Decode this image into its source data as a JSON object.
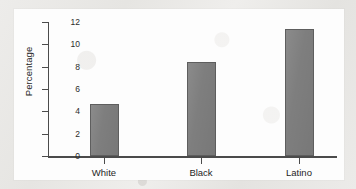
{
  "chart_data": {
    "type": "bar",
    "title": "",
    "subtitle": "",
    "xlabel": "",
    "ylabel": "Percentage",
    "categories": [
      "White",
      "Black",
      "Latino"
    ],
    "values": [
      4.7,
      8.4,
      11.4
    ],
    "series": [
      {
        "name": "Percentage",
        "values": [
          4.7,
          8.4,
          11.4
        ]
      }
    ],
    "ylim": [
      0,
      12
    ],
    "yticks": [
      0,
      2,
      4,
      6,
      8,
      10,
      12
    ],
    "ytick_labels": [
      "0",
      "2",
      "4",
      "6",
      "8",
      "10",
      "12"
    ],
    "grid": false,
    "legend": false,
    "legend_position": "none",
    "bar_color": "#7e7e7e",
    "bar_edge_color": "#5e5e5e",
    "axis_color": "#4b4b4b",
    "plot_background": "#fdfdfd",
    "page_background": "#e9e8e6"
  }
}
